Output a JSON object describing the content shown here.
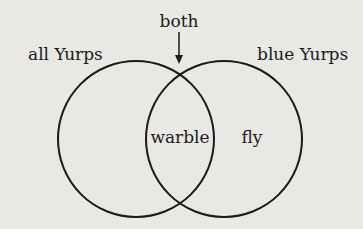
{
  "diagram": {
    "type": "venn",
    "sets": [
      {
        "label": "all Yurps",
        "region_label": ""
      },
      {
        "label": "blue Yurps",
        "region_label": "fly"
      }
    ],
    "intersection": {
      "label": "warble",
      "pointer_label": "both"
    },
    "colors": {
      "stroke": "#1a1a1a",
      "background": "#e9e8e4"
    }
  }
}
